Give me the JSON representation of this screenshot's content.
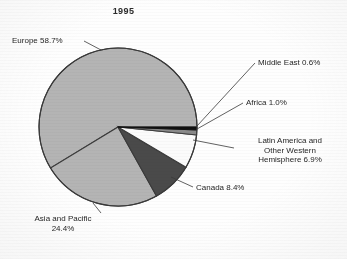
{
  "chart": {
    "title": "1995"
  },
  "chart_data": {
    "type": "pie",
    "title": "1995",
    "xlabel": "",
    "ylabel": "",
    "legend": "none (direct labels with leader lines)",
    "grid": false,
    "units": "percent",
    "total": 100.0,
    "categories": [
      "Europe",
      "Asia and Pacific",
      "Canada",
      "Latin America and Other Western Hemisphere",
      "Africa",
      "Middle East"
    ],
    "values": [
      58.7,
      24.4,
      8.4,
      6.9,
      1.0,
      0.6
    ],
    "slices": [
      {
        "label": "Middle East",
        "value": 0.6,
        "value_text": "0.6%",
        "label_text": "Middle East 0.6%",
        "color": "#111111",
        "start_angle_deg": 0.0,
        "end_angle_deg": 2.16
      },
      {
        "label": "Africa",
        "value": 1.0,
        "value_text": "1.0%",
        "label_text": "Africa 1.0%",
        "color": "#8a8a8a",
        "start_angle_deg": 2.16,
        "end_angle_deg": 5.76
      },
      {
        "label": "Latin America and Other Western Hemisphere",
        "value": 6.9,
        "value_text": "6.9%",
        "label_text_line1": "Latin America and",
        "label_text_line2": "Other Western",
        "label_text_line3": "Hemisphere 6.9%",
        "color": "#fbfbfb",
        "start_angle_deg": 5.76,
        "end_angle_deg": 30.6
      },
      {
        "label": "Canada",
        "value": 8.4,
        "value_text": "8.4%",
        "label_text": "Canada 8.4%",
        "color": "#4a4a4a",
        "start_angle_deg": 30.6,
        "end_angle_deg": 60.84
      },
      {
        "label": "Asia and Pacific",
        "value": 24.4,
        "value_text": "24.4%",
        "label_text_line1": "Asia and Pacific",
        "label_text_line2": "24.4%",
        "color": "#b4b4b4",
        "start_angle_deg": 60.84,
        "end_angle_deg": 148.68
      },
      {
        "label": "Europe",
        "value": 58.7,
        "value_text": "58.7%",
        "label_text": "Europe 58.7%",
        "color": "#b4b4b4",
        "start_angle_deg": 148.68,
        "end_angle_deg": 360.0
      }
    ]
  },
  "labels": {
    "europe": "Europe 58.7%",
    "middle_east": "Middle East 0.6%",
    "africa": "Africa 1.0%",
    "latin_line1": "Latin America and",
    "latin_line2": "Other Western",
    "latin_line3": "Hemisphere 6.9%",
    "canada": "Canada 8.4%",
    "asia_line1": "Asia and Pacific",
    "asia_line2": "24.4%"
  },
  "colors": {
    "slice_light_gray": "#b4b4b4",
    "slice_mid_gray": "#8a8a8a",
    "slice_dark_gray": "#4a4a4a",
    "slice_white": "#fbfbfb",
    "slice_black": "#111111",
    "outline": "#3a3a3a",
    "text": "#262626",
    "background": "#fefefe"
  }
}
